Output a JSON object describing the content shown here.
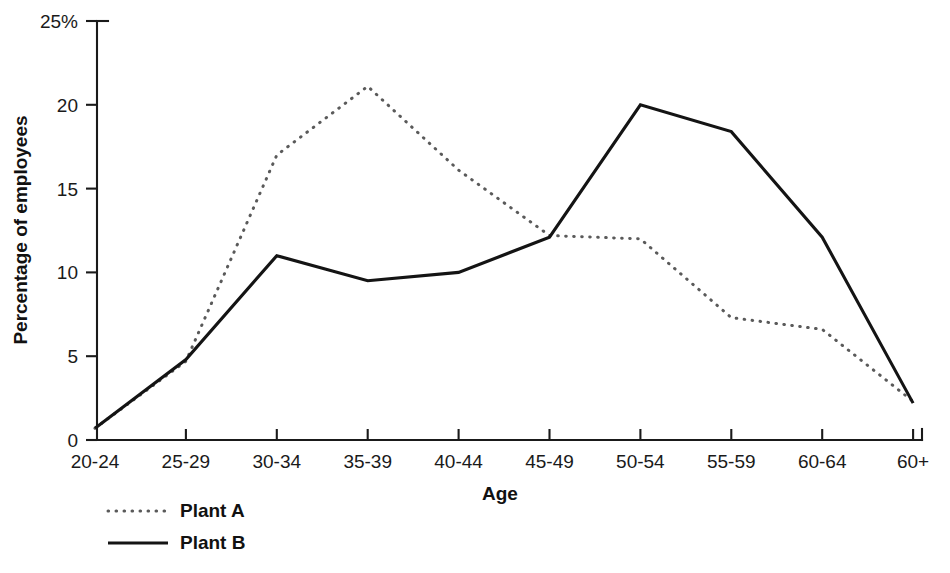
{
  "chart_data": {
    "type": "line",
    "title": "",
    "xlabel": "Age",
    "ylabel": "Percentage of employees",
    "categories": [
      "20-24",
      "25-29",
      "30-34",
      "35-39",
      "40-44",
      "45-49",
      "50-54",
      "55-59",
      "60-64",
      "60+"
    ],
    "ylim": [
      0,
      25
    ],
    "yticks": [
      0,
      5,
      10,
      15,
      20,
      25
    ],
    "ytick_labels": [
      "0",
      "5",
      "10",
      "15",
      "20",
      "25%"
    ],
    "grid": false,
    "legend_position": "bottom-left",
    "series": [
      {
        "name": "Plant A",
        "style": "dotted",
        "color": "#5a5a5a",
        "values": [
          0.7,
          4.7,
          17.0,
          21.1,
          16.1,
          12.2,
          12.0,
          7.3,
          6.6,
          2.3
        ]
      },
      {
        "name": "Plant B",
        "style": "solid",
        "color": "#141414",
        "values": [
          0.7,
          4.8,
          11.0,
          9.5,
          10.0,
          12.1,
          20.0,
          18.4,
          12.1,
          2.2
        ]
      }
    ]
  },
  "axis": {
    "y_unit_suffix": "%",
    "x_title": "Age",
    "y_title": "Percentage of employees"
  },
  "legend": {
    "entries": [
      {
        "label": "Plant A",
        "style": "dotted"
      },
      {
        "label": "Plant B",
        "style": "solid"
      }
    ]
  }
}
